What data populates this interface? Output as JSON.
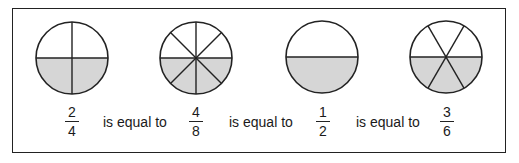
{
  "fill_color": "#d6d6d6",
  "line_color": "#222222",
  "fractions": [
    {
      "numerator": "2",
      "denominator": "4"
    },
    {
      "numerator": "4",
      "denominator": "8"
    },
    {
      "numerator": "1",
      "denominator": "2"
    },
    {
      "numerator": "3",
      "denominator": "6"
    }
  ],
  "connector_text": [
    "is equal to",
    "is equal to",
    "is equal to"
  ],
  "circles": [
    {
      "parts": 4,
      "shaded": 2
    },
    {
      "parts": 8,
      "shaded": 4
    },
    {
      "parts": 2,
      "shaded": 1
    },
    {
      "parts": 6,
      "shaded": 3
    }
  ]
}
